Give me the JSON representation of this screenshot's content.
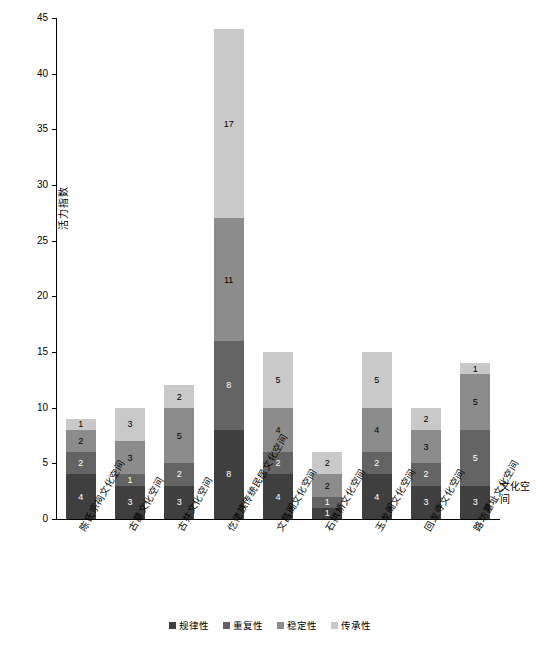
{
  "chart_data": {
    "type": "bar",
    "stacked": true,
    "title": "",
    "xlabel": "文化空间",
    "ylabel": "活力指数",
    "ylim": [
      0,
      45
    ],
    "ytick_step": 5,
    "yticks": [
      0,
      5,
      10,
      15,
      20,
      25,
      30,
      35,
      40,
      45
    ],
    "grid": false,
    "legend_position": "bottom",
    "categories": [
      "陈氏宗祠文化空间",
      "古墓文化空间",
      "古井文化空间",
      "仡佬族传统民居文化空间",
      "文昌阁文化空间",
      "石拱桥文化空间",
      "玉龙阁文化空间",
      "回龙寺文化空间",
      "路坊墓址文化空间"
    ],
    "series": [
      {
        "name": "规律性",
        "color": "#3f3f3f",
        "values": [
          4,
          3,
          3,
          8,
          4,
          1,
          4,
          3,
          3
        ]
      },
      {
        "name": "重复性",
        "color": "#636363",
        "values": [
          2,
          1,
          2,
          8,
          2,
          1,
          2,
          2,
          5
        ]
      },
      {
        "name": "稳定性",
        "color": "#8c8c8c",
        "values": [
          2,
          3,
          5,
          11,
          4,
          2,
          4,
          3,
          5
        ]
      },
      {
        "name": "传承性",
        "color": "#c9c9c9",
        "values": [
          1,
          3,
          2,
          17,
          5,
          2,
          5,
          2,
          1
        ]
      }
    ],
    "totals": [
      9,
      10,
      12,
      44,
      15,
      6,
      15,
      10,
      14
    ]
  },
  "legend": {
    "items": [
      "规律性",
      "重复性",
      "稳定性",
      "传承性"
    ]
  }
}
